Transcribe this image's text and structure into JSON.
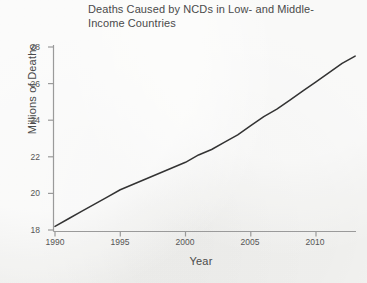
{
  "chart_data": {
    "type": "line",
    "title_line1": "Deaths Caused by NCDs in Low- and Middle-",
    "title_line2": "Income Countries",
    "xlabel": "Year",
    "ylabel": "Millions of Deaths",
    "xlim": [
      1990,
      2013
    ],
    "ylim": [
      18,
      28
    ],
    "grid": false,
    "legend": false,
    "xticks": [
      1990,
      1995,
      2000,
      2005,
      2010
    ],
    "yticks": [
      18,
      20,
      22,
      24,
      26,
      28
    ],
    "series": [
      {
        "name": "Deaths Caused by NCDs",
        "color": "#333333",
        "x": [
          1990,
          1991,
          1992,
          1993,
          1994,
          1995,
          1996,
          1997,
          1998,
          1999,
          2000,
          2001,
          2002,
          2003,
          2004,
          2005,
          2006,
          2007,
          2008,
          2009,
          2010,
          2011,
          2012,
          2013
        ],
        "values": [
          18.2,
          18.6,
          19.0,
          19.4,
          19.8,
          20.2,
          20.5,
          20.8,
          21.1,
          21.4,
          21.7,
          22.1,
          22.4,
          22.8,
          23.2,
          23.7,
          24.2,
          24.6,
          25.1,
          25.6,
          26.1,
          26.6,
          27.1,
          27.5
        ]
      }
    ]
  },
  "axes": {
    "x_tick_labels": [
      "1990",
      "1995",
      "2000",
      "2005",
      "2010"
    ],
    "y_tick_labels": [
      "18",
      "20",
      "22",
      "24",
      "26",
      "28"
    ]
  }
}
